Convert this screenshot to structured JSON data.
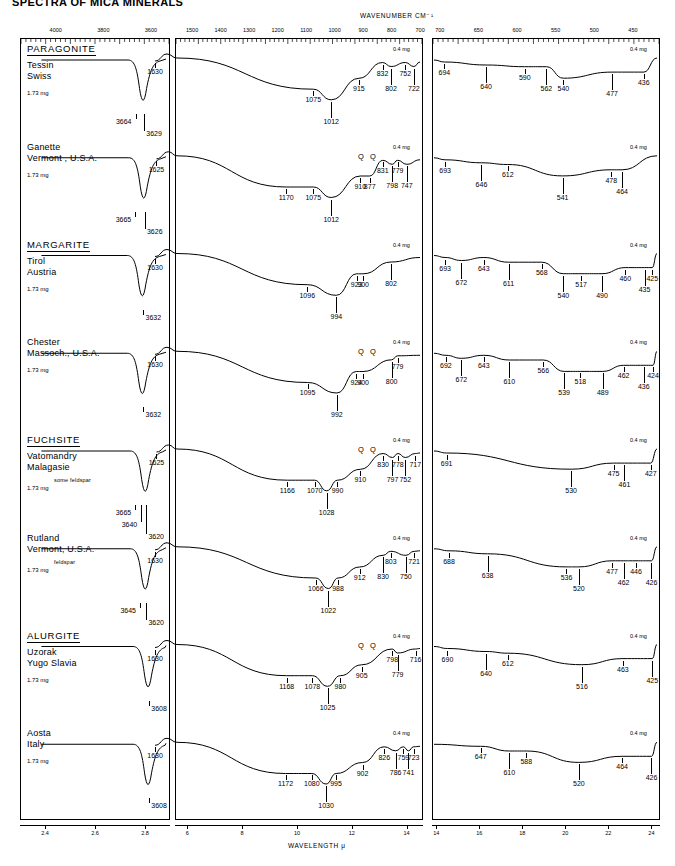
{
  "figure": {
    "title": "SPECTRA OF MICA MINERALS",
    "top_axis_title": "WAVENUMBER  CM⁻¹",
    "bottom_axis_title": "WAVELENGTH   μ",
    "mg_tag": "0.4 mg",
    "sample_mass": "1.73 mg",
    "q_marker": "Q"
  },
  "panels": {
    "left": {
      "wavenumber_ticks": [
        "4000",
        "3800",
        "3600"
      ],
      "wavelength_ticks": [
        "2.4",
        "2.6",
        "2.8"
      ]
    },
    "middle": {
      "wavenumber_ticks": [
        "1500",
        "1400",
        "1300",
        "1200",
        "1100",
        "1000",
        "900",
        "800",
        "700"
      ],
      "wavelength_ticks": [
        "6",
        "8",
        "10",
        "12",
        "14"
      ]
    },
    "right": {
      "wavenumber_ticks": [
        "700",
        "650",
        "600",
        "550",
        "500",
        "450"
      ],
      "wavelength_ticks": [
        "14",
        "16",
        "18",
        "20",
        "22",
        "24"
      ]
    }
  },
  "groups": [
    {
      "name": "PARAGONITE",
      "at": 0
    },
    {
      "name": "MARGARITE",
      "at": 2
    },
    {
      "name": "FUCHSITE",
      "at": 4
    },
    {
      "name": "ALURGITE",
      "at": 6
    }
  ],
  "samples": [
    {
      "locality_line1": "Tessin",
      "locality_line2": "Swiss",
      "note": "",
      "mass": "1.73 mg",
      "oh_peaks": [
        "3664",
        "3629"
      ],
      "mid_peaks": [
        "1630",
        "1075",
        "1012",
        "915",
        "832",
        "802",
        "752",
        "722"
      ],
      "far_peaks": [
        "694",
        "640",
        "590",
        "562",
        "540",
        "477",
        "436"
      ],
      "q_count": 0
    },
    {
      "locality_line1": "Ganette",
      "locality_line2": "Vermont , U.S.A.",
      "note": "",
      "mass": "1.73 mg",
      "oh_peaks": [
        "3665",
        "3626"
      ],
      "mid_peaks": [
        "1625",
        "1170",
        "1075",
        "1012",
        "910",
        "877",
        "831",
        "798",
        "779",
        "747"
      ],
      "far_peaks": [
        "693",
        "646",
        "612",
        "541",
        "478",
        "464"
      ],
      "q_count": 2
    },
    {
      "locality_line1": "Tirol",
      "locality_line2": "Austria",
      "note": "",
      "mass": "1.73 mg",
      "oh_peaks": [
        "3632"
      ],
      "mid_peaks": [
        "1630",
        "1096",
        "994",
        "923",
        "900",
        "802"
      ],
      "far_peaks": [
        "693",
        "672",
        "643",
        "611",
        "568",
        "540",
        "517",
        "490",
        "460",
        "435",
        "425"
      ],
      "q_count": 0
    },
    {
      "locality_line1": "Chester",
      "locality_line2": "Massoch., U.S.A.",
      "note": "",
      "mass": "1.73 mg",
      "oh_peaks": [
        "3632"
      ],
      "mid_peaks": [
        "1630",
        "1095",
        "992",
        "924",
        "900",
        "800",
        "779"
      ],
      "far_peaks": [
        "692",
        "672",
        "643",
        "610",
        "566",
        "539",
        "518",
        "489",
        "462",
        "436",
        "424"
      ],
      "q_count": 2
    },
    {
      "locality_line1": "Vatomandry",
      "locality_line2": "Malagasie",
      "note": "some  feldspar",
      "mass": "1.73 mg",
      "oh_peaks": [
        "3665",
        "3640",
        "3620"
      ],
      "mid_peaks": [
        "1625",
        "1166",
        "1070",
        "1028",
        "990",
        "910",
        "830",
        "797",
        "778",
        "752",
        "717"
      ],
      "far_peaks": [
        "691",
        "530",
        "475",
        "461",
        "427"
      ],
      "q_count": 2
    },
    {
      "locality_line1": "Rutland",
      "locality_line2": "Vermont, U.S.A.",
      "note": "feldspar",
      "mass": "1.73 mg",
      "oh_peaks": [
        "3645",
        "3620"
      ],
      "mid_peaks": [
        "1630",
        "1066",
        "1022",
        "988",
        "912",
        "830",
        "803",
        "750",
        "721"
      ],
      "far_peaks": [
        "688",
        "638",
        "536",
        "520",
        "477",
        "462",
        "446",
        "426"
      ],
      "q_count": 0
    },
    {
      "locality_line1": "Uzorak",
      "locality_line2": "Yugo  Slavia",
      "note": "",
      "mass": "1.73 mg",
      "oh_peaks": [
        "3608"
      ],
      "mid_peaks": [
        "1630",
        "1168",
        "1078",
        "1025",
        "980",
        "905",
        "798",
        "779",
        "716"
      ],
      "far_peaks": [
        "690",
        "640",
        "612",
        "516",
        "463",
        "425"
      ],
      "q_count": 2
    },
    {
      "locality_line1": "Aosta",
      "locality_line2": "Italy",
      "note": "",
      "mass": "1.73 mg",
      "oh_peaks": [
        "3608"
      ],
      "mid_peaks": [
        "1630",
        "1172",
        "1080",
        "1030",
        "995",
        "902",
        "826",
        "786",
        "759",
        "741",
        "723"
      ],
      "far_peaks": [
        "647",
        "610",
        "588",
        "520",
        "464",
        "426"
      ],
      "q_count": 0
    }
  ]
}
